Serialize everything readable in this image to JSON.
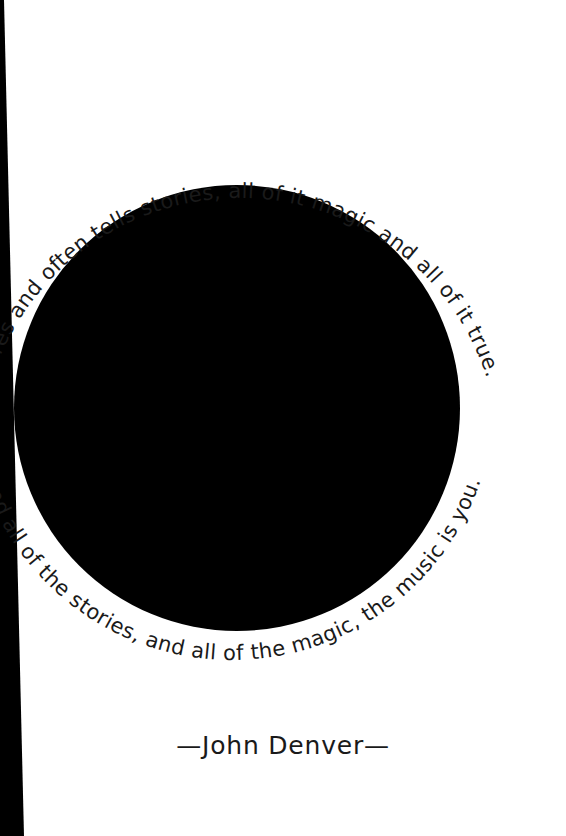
{
  "page": {
    "width": 566,
    "height": 836,
    "background_color": "#ffffff",
    "ink_color": "#1a1a1a",
    "disc_color": "#000000",
    "gutter_color": "#000000"
  },
  "artwork": {
    "disc_name": "black-circle",
    "disc_center_x": 237,
    "disc_center_y": 408,
    "disc_radius": 223,
    "gutter_top_width": 3,
    "gutter_bottom_width": 22
  },
  "quote": {
    "upper_arc_text": "pictures and often tells stories, all of it magic and all of it true.",
    "lower_arc_text": "ctures and all of the stories, and all of the magic, the music is you.",
    "upper_arc_font_size": 21,
    "lower_arc_font_size": 21,
    "upper_arc_radius": 260,
    "lower_arc_radius": 262
  },
  "attribution": {
    "text": "—John Denver—",
    "author": "John Denver"
  }
}
